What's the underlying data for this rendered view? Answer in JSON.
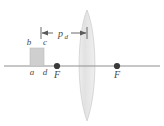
{
  "figure": {
    "type": "optics-ray-diagram",
    "background_color": "#ffffff"
  },
  "axis": {
    "name": "optical-axis",
    "color": "#8f8f8f",
    "y": 66,
    "x_start": 4,
    "x_end": 160
  },
  "object": {
    "name": "object-block",
    "fill_color": "#cfcfcf",
    "stroke_color": "#b8b8b8",
    "x": 30,
    "y": 48,
    "width": 14,
    "height": 18,
    "corner_labels": {
      "top_left": "b",
      "top_right": "c",
      "bottom_left": "a",
      "bottom_right": "d"
    }
  },
  "lens": {
    "name": "converging-lens",
    "fill_color": "#e4e4e4",
    "stroke_color": "#c6c6c6",
    "center_x": 87,
    "top_y": 10,
    "bottom_y": 121,
    "half_width": 11
  },
  "focal_points": [
    {
      "name": "focal-point-left",
      "label": "F",
      "x": 57,
      "y": 66
    },
    {
      "name": "focal-point-right",
      "label": "F",
      "x": 117,
      "y": 66
    }
  ],
  "dimension": {
    "name": "object-distance-dimension",
    "label_base": "p",
    "label_sub": "d",
    "label_full": "p_d",
    "y": 33,
    "x_start": 41,
    "x_end": 87,
    "color": "#5a5a5a"
  },
  "colors": {
    "line": "#8f8f8f",
    "dark_line": "#5a5a5a",
    "text": "#4a4a4a",
    "object_fill": "#cfcfcf",
    "lens_fill": "#e4e4e4",
    "dot": "#3a3a3a"
  }
}
